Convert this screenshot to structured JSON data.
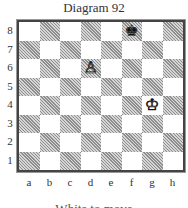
{
  "title": "Diagram 92",
  "board": {
    "orientation": "white",
    "ranks": [
      "8",
      "7",
      "6",
      "5",
      "4",
      "3",
      "2",
      "1"
    ],
    "files": [
      "a",
      "b",
      "c",
      "d",
      "e",
      "f",
      "g",
      "h"
    ],
    "light_color": "#ffffff",
    "dark_color": "#bdbdbd",
    "pieces": [
      {
        "square": "f8",
        "piece": "king",
        "color": "black",
        "glyph": "♚"
      },
      {
        "square": "d6",
        "piece": "pawn",
        "color": "white",
        "glyph": "♙"
      },
      {
        "square": "g4",
        "piece": "king",
        "color": "white",
        "glyph": "♔"
      }
    ]
  },
  "caption": "White to move"
}
